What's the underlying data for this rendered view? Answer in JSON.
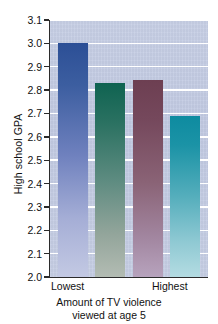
{
  "chart_data": {
    "type": "bar",
    "title": "",
    "subtitle": "",
    "xlabel_lines": [
      "Amount of TV violence",
      "viewed at age 5"
    ],
    "ylabel": "High school GPA",
    "categories": [
      "Lowest",
      "",
      "",
      "Highest"
    ],
    "values": [
      3.0,
      2.83,
      2.845,
      2.69
    ],
    "ylim": [
      2.0,
      3.1
    ],
    "yticks": [
      "3.1",
      "3.0",
      "2.9",
      "2.8",
      "2.7",
      "2.6",
      "2.5",
      "2.4",
      "2.3",
      "2.2",
      "2.1",
      "2.0"
    ],
    "ytick_values": [
      3.1,
      3.0,
      2.9,
      2.8,
      2.7,
      2.6,
      2.5,
      2.4,
      2.3,
      2.2,
      2.1,
      2.0
    ],
    "xtick_labels": [
      "Lowest",
      "Highest"
    ],
    "grid": true,
    "legend": "none",
    "bar_colors": [
      "#2c4f96",
      "#0f6351",
      "#6d3f52",
      "#0e8ba0"
    ],
    "plot_background": "#c5cde4",
    "gridline_color": "#ffffff",
    "axis_color": "#2b2b2b"
  }
}
